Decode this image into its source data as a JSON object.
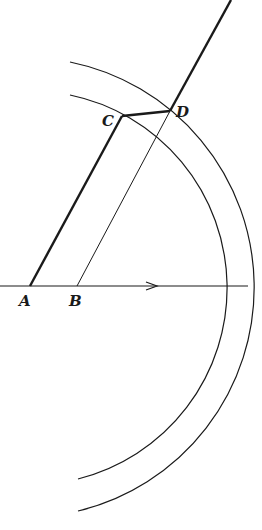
{
  "diagram": {
    "points": {
      "A": {
        "label": "A",
        "x": 30,
        "y": 286
      },
      "B": {
        "label": "B",
        "x": 77,
        "y": 286
      },
      "C": {
        "label": "C",
        "x": 122,
        "y": 116
      },
      "D": {
        "label": "D",
        "x": 170,
        "y": 111
      }
    },
    "axis": {
      "direction_arrow": "right"
    },
    "arcs": [
      "inner",
      "outer"
    ],
    "stroke_color": "#1a1a1a",
    "background": "#ffffff"
  }
}
